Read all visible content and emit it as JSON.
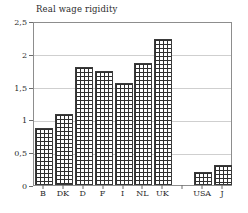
{
  "chart_data": {
    "type": "bar",
    "title": "Real wage rigidity",
    "xlabel": "",
    "ylabel": "",
    "ylim": [
      0,
      2.5
    ],
    "grid": true,
    "legend": "none",
    "decimal_separator": ",",
    "categories": [
      "B",
      "DK",
      "D",
      "F",
      "I",
      "NL",
      "UK",
      "",
      "USA",
      "J"
    ],
    "values": [
      0.87,
      1.08,
      1.8,
      1.74,
      1.55,
      1.86,
      2.23,
      null,
      0.2,
      0.3
    ],
    "ytick_labels": [
      "0",
      "0,5",
      "1",
      "1,5",
      "2",
      "2,5"
    ],
    "ytick_values": [
      0,
      0.5,
      1,
      1.5,
      2,
      2.5
    ],
    "bars": [
      {
        "label": "B",
        "value": 0.87
      },
      {
        "label": "DK",
        "value": 1.08
      },
      {
        "label": "D",
        "value": 1.8
      },
      {
        "label": "F",
        "value": 1.74
      },
      {
        "label": "I",
        "value": 1.55
      },
      {
        "label": "NL",
        "value": 1.86
      },
      {
        "label": "UK",
        "value": 2.23
      },
      {
        "label": "",
        "value": null
      },
      {
        "label": "USA",
        "value": 0.2
      },
      {
        "label": "J",
        "value": 0.3
      }
    ],
    "colors": {
      "bar_fill": "#ffffff",
      "bar_hatch": "#2f2f2f",
      "bar_edge": "#3a3a3a",
      "gridline": "#cfcfcf",
      "axis": "#8d8d8d",
      "text": "#2b2b2b",
      "background": "#ffffff"
    }
  }
}
